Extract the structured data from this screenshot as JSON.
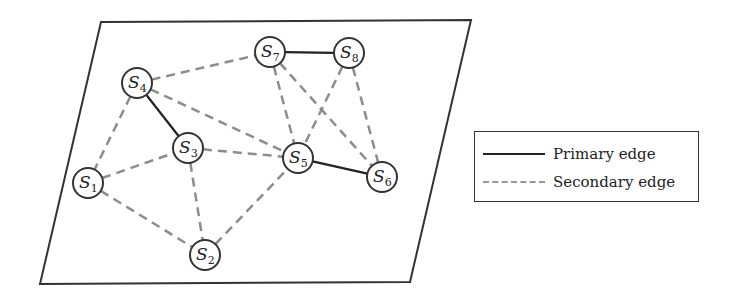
{
  "diagram": {
    "type": "sensor-network-graph",
    "plane": {
      "corners": [
        [
          101,
          22
        ],
        [
          471,
          20
        ],
        [
          410,
          282
        ],
        [
          40,
          284
        ]
      ],
      "stroke": "#333333"
    },
    "nodes": [
      {
        "id": "S1",
        "letter": "S",
        "sub": "1",
        "x": 88,
        "y": 183
      },
      {
        "id": "S2",
        "letter": "S",
        "sub": "2",
        "x": 205,
        "y": 255
      },
      {
        "id": "S3",
        "letter": "S",
        "sub": "3",
        "x": 188,
        "y": 148
      },
      {
        "id": "S4",
        "letter": "S",
        "sub": "4",
        "x": 137,
        "y": 83
      },
      {
        "id": "S5",
        "letter": "S",
        "sub": "5",
        "x": 298,
        "y": 158
      },
      {
        "id": "S6",
        "letter": "S",
        "sub": "6",
        "x": 382,
        "y": 177
      },
      {
        "id": "S7",
        "letter": "S",
        "sub": "7",
        "x": 270,
        "y": 52
      },
      {
        "id": "S8",
        "letter": "S",
        "sub": "8",
        "x": 349,
        "y": 53
      }
    ],
    "primary_edges": [
      [
        "S4",
        "S3"
      ],
      [
        "S7",
        "S8"
      ],
      [
        "S5",
        "S6"
      ]
    ],
    "secondary_edges": [
      [
        "S4",
        "S1"
      ],
      [
        "S4",
        "S7"
      ],
      [
        "S4",
        "S5"
      ],
      [
        "S1",
        "S3"
      ],
      [
        "S1",
        "S2"
      ],
      [
        "S3",
        "S2"
      ],
      [
        "S3",
        "S5"
      ],
      [
        "S2",
        "S5"
      ],
      [
        "S7",
        "S5"
      ],
      [
        "S7",
        "S6"
      ],
      [
        "S8",
        "S5"
      ],
      [
        "S8",
        "S6"
      ]
    ],
    "colors": {
      "primary": "#222222",
      "secondary": "#8c8c8c",
      "node_stroke": "#333333",
      "node_fill": "#ffffff"
    }
  },
  "legend": {
    "items": [
      {
        "style": "solid",
        "label": "Primary edge"
      },
      {
        "style": "dashed",
        "label": "Secondary edge"
      }
    ]
  }
}
